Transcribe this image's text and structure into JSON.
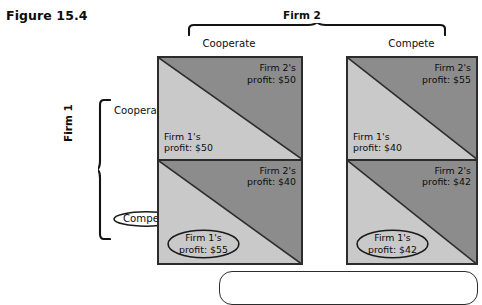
{
  "figure": {
    "label": "Figure 15.4"
  },
  "column_axis": {
    "title": "Firm 2",
    "headers": [
      {
        "label": "Cooperate"
      },
      {
        "label": "Compete"
      }
    ]
  },
  "row_axis": {
    "title": "Firm 1",
    "headers": [
      {
        "label": "Cooperate",
        "circled": false
      },
      {
        "label": "Compete",
        "circled": true
      }
    ]
  },
  "matrix": {
    "cells": [
      {
        "row": "Cooperate",
        "column": "Cooperate",
        "upper_party": "Firm 2's",
        "upper_value": "profit: $50",
        "lower_party": "Firm 1's",
        "lower_value": "profit: $50",
        "lower_circled": false
      },
      {
        "row": "Cooperate",
        "column": "Compete",
        "upper_party": "Firm 2's",
        "upper_value": "profit: $55",
        "lower_party": "Firm 1's",
        "lower_value": "profit: $40",
        "lower_circled": false
      },
      {
        "row": "Compete",
        "column": "Cooperate",
        "upper_party": "Firm 2's",
        "upper_value": "profit: $40",
        "lower_party": "Firm 1's",
        "lower_value": "profit: $55",
        "lower_circled": true
      },
      {
        "row": "Compete",
        "column": "Compete",
        "upper_party": "Firm 2's",
        "upper_value": "profit: $42",
        "lower_party": "Firm 1's",
        "lower_value": "profit: $42",
        "lower_circled": true
      }
    ]
  },
  "callout": {
    "text": ""
  },
  "colors": {
    "upper_triangle": "#8c8c8c",
    "lower_triangle": "#c9c9c9",
    "border": "#2c2c2c",
    "text": "#0d0d0d",
    "background": "#ffffff"
  }
}
